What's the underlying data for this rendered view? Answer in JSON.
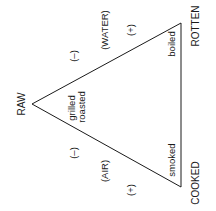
{
  "diagram": {
    "orientation": "rotated -90deg",
    "line_color": "#1a1a1a",
    "vertices": {
      "raw": "RAW",
      "rotten": "ROTTEN",
      "cooked": "COOKED"
    },
    "edge_labels": {
      "water_side": {
        "minus": "(–)",
        "medium": "(WATER)",
        "plus": "(+)"
      },
      "air_side": {
        "minus": "(–)",
        "medium": "(AIR)",
        "plus": "(+)"
      }
    },
    "interior_labels": {
      "grilled": "grilled",
      "roasted": "roasted",
      "boiled": "boiled",
      "smoked": "smoked"
    }
  }
}
